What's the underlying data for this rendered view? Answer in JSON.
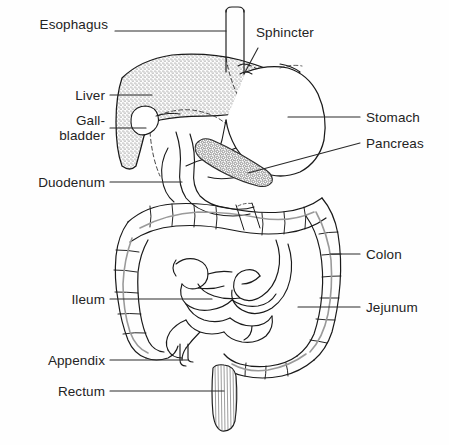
{
  "diagram": {
    "style": "black-and-white line art with stipple shading",
    "background_color": "#fefefe",
    "line_color": "#1a1a1a",
    "text_color": "#232323"
  },
  "labels": {
    "esophagus": {
      "text": "Esophagus",
      "x": 108,
      "y": 24,
      "align": "right",
      "width": 92
    },
    "sphincter": {
      "text": "Sphincter",
      "x": 258,
      "y": 32,
      "align": "left",
      "width": 90
    },
    "liver": {
      "text": "Liver",
      "x": 45,
      "y": 88,
      "align": "right",
      "width": 60
    },
    "gallbladder": {
      "text": "Gall-\nbladder",
      "x": 30,
      "y": 114,
      "align": "right",
      "width": 75
    },
    "duodenum": {
      "text": "Duodenum",
      "x": 18,
      "y": 175,
      "align": "right",
      "width": 88
    },
    "stomach": {
      "text": "Stomach",
      "x": 366,
      "y": 109,
      "align": "left",
      "width": 78
    },
    "pancreas": {
      "text": "Pancreas",
      "x": 366,
      "y": 136,
      "align": "left",
      "width": 80
    },
    "colon": {
      "text": "Colon",
      "x": 366,
      "y": 246,
      "align": "left",
      "width": 55
    },
    "jejunum": {
      "text": "Jejunum",
      "x": 366,
      "y": 300,
      "align": "left",
      "width": 72
    },
    "ileum": {
      "text": "Ileum",
      "x": 57,
      "y": 292,
      "align": "right",
      "width": 48
    },
    "appendix": {
      "text": "Appendix",
      "x": 26,
      "y": 353,
      "align": "right",
      "width": 80
    },
    "rectum": {
      "text": "Rectum",
      "x": 39,
      "y": 384,
      "align": "right",
      "width": 67
    }
  },
  "organs": [
    {
      "name": "esophagus",
      "description": "narrow vertical tube at top center entering stomach"
    },
    {
      "name": "sphincter",
      "description": "cardiac sphincter at esophagus-stomach junction"
    },
    {
      "name": "liver",
      "description": "large stippled wedge-shaped organ upper left"
    },
    {
      "name": "gallbladder",
      "description": "small pear-shaped sac beneath the liver"
    },
    {
      "name": "stomach",
      "description": "large rounded J-shaped sac upper right"
    },
    {
      "name": "pancreas",
      "description": "elongated granular lobulated gland below stomach"
    },
    {
      "name": "duodenum",
      "description": "C-shaped first section of small intestine"
    },
    {
      "name": "jejunum",
      "description": "coiled middle small intestine"
    },
    {
      "name": "ileum",
      "description": "coiled lower small intestine"
    },
    {
      "name": "colon",
      "description": "large intestine framing the small intestine with haustra"
    },
    {
      "name": "appendix",
      "description": "small hooked projection from the cecum"
    },
    {
      "name": "rectum",
      "description": "terminal striated muscular segment at bottom center"
    }
  ]
}
